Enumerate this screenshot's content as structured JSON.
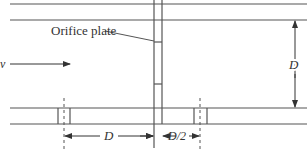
{
  "diagram": {
    "labels": {
      "orifice_plate": "Orifice plate",
      "velocity": "v",
      "diameter_vertical": "D",
      "upstream_distance": "D",
      "downstream_distance": "D/2"
    },
    "colors": {
      "line": "#555555",
      "text": "#333333",
      "background": "#ffffff"
    }
  }
}
